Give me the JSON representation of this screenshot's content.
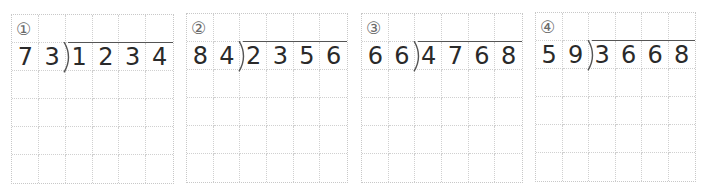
{
  "worksheet": {
    "grid": {
      "columns": 6,
      "rows": 6
    },
    "problems": [
      {
        "number_label": "①",
        "divisor": [
          "7",
          "3"
        ],
        "dividend": [
          "1",
          "2",
          "3",
          "4"
        ],
        "box": {
          "left": 11,
          "top": 14,
          "width": 163,
          "height": 170
        }
      },
      {
        "number_label": "②",
        "divisor": [
          "8",
          "4"
        ],
        "dividend": [
          "2",
          "3",
          "5",
          "6"
        ],
        "box": {
          "left": 186,
          "top": 13,
          "width": 162,
          "height": 170
        }
      },
      {
        "number_label": "③",
        "divisor": [
          "6",
          "6"
        ],
        "dividend": [
          "4",
          "7",
          "6",
          "8"
        ],
        "box": {
          "left": 361,
          "top": 13,
          "width": 162,
          "height": 170
        }
      },
      {
        "number_label": "④",
        "divisor": [
          "5",
          "9"
        ],
        "dividend": [
          "3",
          "6",
          "6",
          "8"
        ],
        "box": {
          "left": 535,
          "top": 12,
          "width": 161,
          "height": 170
        }
      }
    ]
  }
}
